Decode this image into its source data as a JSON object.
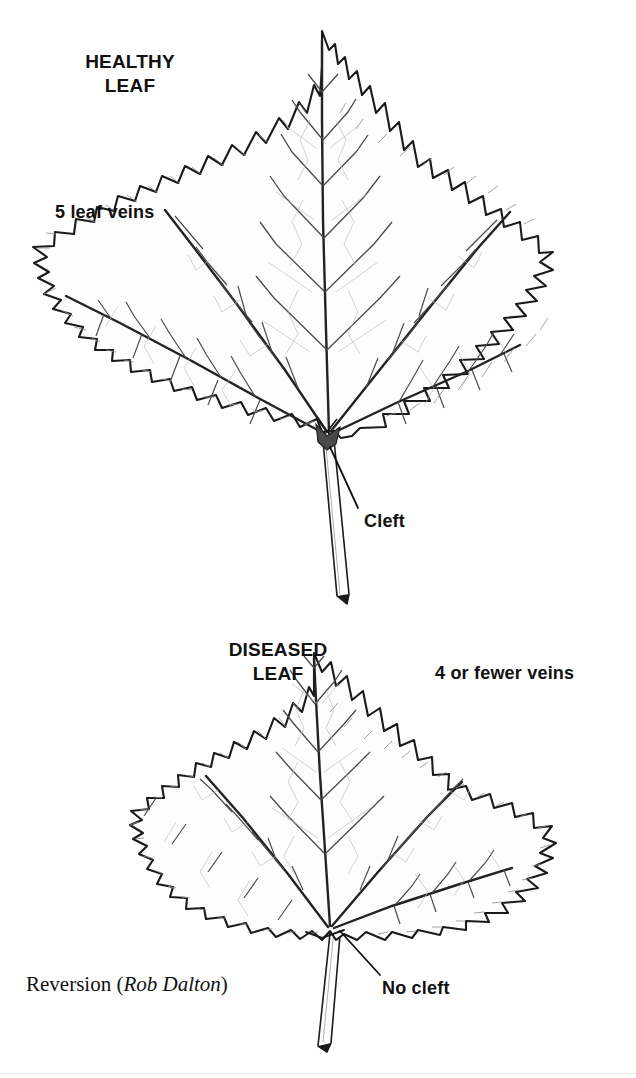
{
  "figure": {
    "type": "diagram",
    "credit_prefix": "Reversion (",
    "credit_name": "Rob Dalton",
    "credit_suffix": ")"
  },
  "healthy": {
    "heading_line1": "HEALTHY",
    "heading_line2": "LEAF",
    "veins_label": "5 leaf veins",
    "cleft_label": "Cleft",
    "vein_count": 5,
    "has_cleft": true
  },
  "diseased": {
    "heading_line1": "DISEASED",
    "heading_line2": "LEAF",
    "veins_label": "4 or fewer veins",
    "nocleft_label": "No cleft",
    "vein_count": 4,
    "has_cleft": false
  },
  "colors": {
    "background": "#ffffff",
    "ink": "#111111",
    "outline": "#1a1a1a",
    "vein_major": "#222222",
    "vein_minor": "#8d8d8d",
    "vein_fine": "#b9b9b9",
    "blade_fill": "#fdfdfd"
  }
}
